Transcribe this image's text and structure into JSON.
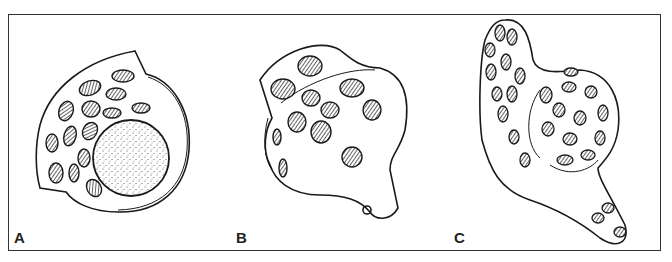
{
  "figure": {
    "panels": [
      {
        "label": "A",
        "description": "round shell with large stippled circle and hatched ovals"
      },
      {
        "label": "B",
        "description": "lobed shell with hatched ovals and curled tab"
      },
      {
        "label": "C",
        "description": "elongated curved shell with many hatched ovals"
      }
    ],
    "colors": {
      "line": "#1a1a1a",
      "background": "#ffffff",
      "frame": "#333333"
    }
  }
}
